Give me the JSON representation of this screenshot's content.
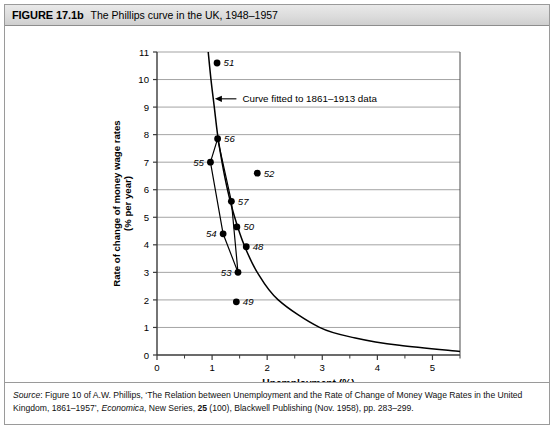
{
  "figure": {
    "number": "FIGURE 17.1b",
    "title": "The Phillips curve in the UK, 1948–1957"
  },
  "source": {
    "label": "Source",
    "part1": ": Figure 10 of A.W. Phillips, ‘The Relation between Unemployment and the Rate of Change of Money Wage Rates in the United Kingdom, 1861–1957’, ",
    "journal": "Economica",
    "part2": ", New Series, ",
    "volume": "25",
    "part3": " (100), Blackwell Publishing (Nov. 1958), pp. 283–299."
  },
  "chart_data": {
    "type": "scatter",
    "title": "The Phillips curve in the UK, 1948–1957",
    "xlabel": "Unemployment (%)",
    "ylabel": "Rate of change of money wage rates\n(% per year)",
    "ylabel_line1": "Rate of change of money wage rates",
    "ylabel_line2": "(% per year)",
    "xlim": [
      0,
      5.5
    ],
    "ylim": [
      0,
      11
    ],
    "xticks": [
      0,
      1,
      2,
      3,
      4,
      5
    ],
    "xticklabels": [
      "0",
      "1",
      "2",
      "3",
      "4",
      "5"
    ],
    "xminorticks": [
      0.5,
      1.5,
      2.5,
      3.5,
      4.5,
      5.5
    ],
    "yticks": [
      0,
      1,
      2,
      3,
      4,
      5,
      6,
      7,
      8,
      9,
      10,
      11
    ],
    "yticklabels": [
      "0",
      "1",
      "2",
      "3",
      "4",
      "5",
      "6",
      "7",
      "8",
      "9",
      "10",
      "11"
    ],
    "grid": "horizontal",
    "legend": "none",
    "points": [
      {
        "label": "48",
        "x": 1.62,
        "y": 3.93,
        "label_pos": "right"
      },
      {
        "label": "49",
        "x": 1.44,
        "y": 1.93,
        "label_pos": "right"
      },
      {
        "label": "50",
        "x": 1.45,
        "y": 4.65,
        "label_pos": "right"
      },
      {
        "label": "51",
        "x": 1.09,
        "y": 10.6,
        "label_pos": "right"
      },
      {
        "label": "52",
        "x": 1.82,
        "y": 6.6,
        "label_pos": "right"
      },
      {
        "label": "53",
        "x": 1.47,
        "y": 3.0,
        "label_pos": "left"
      },
      {
        "label": "54",
        "x": 1.2,
        "y": 4.4,
        "label_pos": "left"
      },
      {
        "label": "55",
        "x": 0.97,
        "y": 7.0,
        "label_pos": "left"
      },
      {
        "label": "56",
        "x": 1.1,
        "y": 7.85,
        "label_pos": "right"
      },
      {
        "label": "57",
        "x": 1.35,
        "y": 5.58,
        "label_pos": "right"
      }
    ],
    "path_order": [
      "48",
      "49",
      "50",
      "51",
      "52",
      "53",
      "54",
      "55",
      "56",
      "57"
    ],
    "connected_path": [
      "55",
      "56",
      "57",
      "53",
      "54",
      "55"
    ],
    "fitted_curve": {
      "annotation": "Curve fitted to 1861–1913 data",
      "description": "Phillips curve fitted to 1861–1913 data",
      "samples": [
        {
          "x": 0.93,
          "y": 11.0
        },
        {
          "x": 0.98,
          "y": 10.0
        },
        {
          "x": 1.04,
          "y": 9.0
        },
        {
          "x": 1.1,
          "y": 8.0
        },
        {
          "x": 1.18,
          "y": 7.0
        },
        {
          "x": 1.28,
          "y": 6.0
        },
        {
          "x": 1.41,
          "y": 5.0
        },
        {
          "x": 1.58,
          "y": 4.0
        },
        {
          "x": 1.82,
          "y": 3.0
        },
        {
          "x": 2.2,
          "y": 2.0
        },
        {
          "x": 2.95,
          "y": 1.0
        },
        {
          "x": 3.6,
          "y": 0.62
        },
        {
          "x": 4.4,
          "y": 0.35
        },
        {
          "x": 5.5,
          "y": 0.13
        }
      ]
    },
    "annotations": [
      {
        "text": "Curve fitted to 1861–1913 data",
        "x": 1.55,
        "y": 9.3,
        "arrow_to_x": 1.05,
        "arrow_to_y": 9.3
      }
    ]
  }
}
